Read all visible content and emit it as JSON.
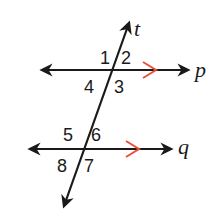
{
  "diagram": {
    "colors": {
      "line": "#1a1a1a",
      "parallel_marker": "#e8503a",
      "background": "#ffffff"
    },
    "lines": {
      "transversal": {
        "label": "t"
      },
      "top": {
        "label": "p"
      },
      "bottom": {
        "label": "q"
      }
    },
    "angles_at_p": [
      "1",
      "2",
      "4",
      "3"
    ],
    "angles_at_q": [
      "5",
      "6",
      "8",
      "7"
    ],
    "parallel_markers": "single arrowhead markers on p and q indicate p ∥ q"
  }
}
